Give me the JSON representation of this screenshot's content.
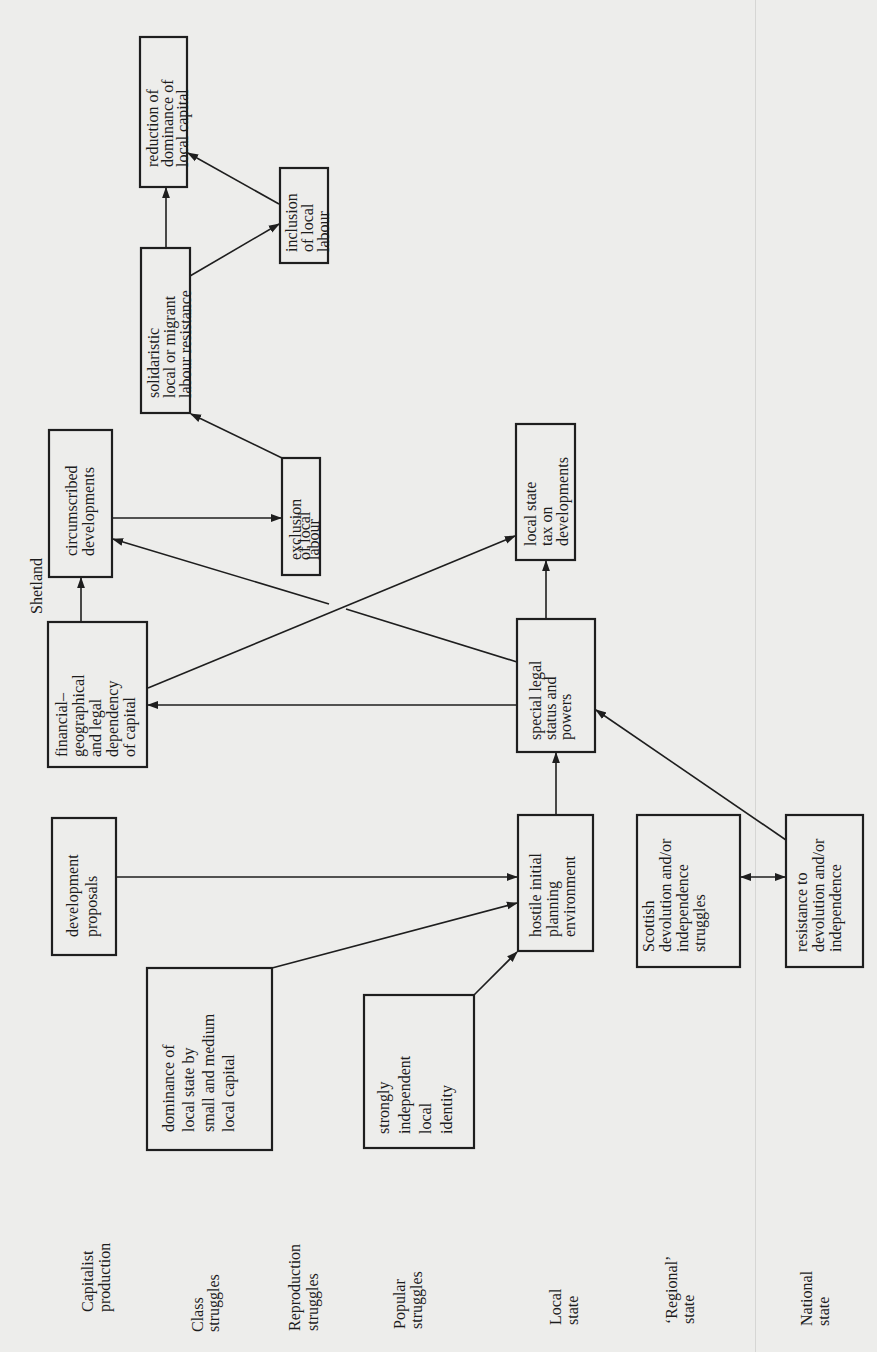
{
  "figure": {
    "orientation": "rotated-90-ccw",
    "region_label": "Shetland"
  },
  "row_labels": [
    {
      "id": "capitalist-production",
      "lines": [
        "Capitalist",
        "production"
      ]
    },
    {
      "id": "class-struggles",
      "lines": [
        "Class",
        "struggles"
      ]
    },
    {
      "id": "reproduction-struggles",
      "lines": [
        "Reproduction",
        "struggles"
      ]
    },
    {
      "id": "popular-struggles",
      "lines": [
        "Popular",
        "struggles"
      ]
    },
    {
      "id": "local-state",
      "lines": [
        "Local",
        "state"
      ]
    },
    {
      "id": "regional-state",
      "lines": [
        "‘Regional’",
        "state"
      ]
    },
    {
      "id": "national-state",
      "lines": [
        "National",
        "state"
      ]
    }
  ],
  "nodes": [
    {
      "id": "development-proposals",
      "lines": [
        "development",
        "proposals"
      ]
    },
    {
      "id": "dominance-local-state",
      "lines": [
        "dominance of",
        "local state by",
        "small and medium",
        "local capital"
      ]
    },
    {
      "id": "strongly-independent",
      "lines": [
        "strongly",
        "independent",
        "local",
        "identity"
      ]
    },
    {
      "id": "hostile-planning",
      "lines": [
        "hostile initial",
        "planning",
        "environment"
      ]
    },
    {
      "id": "scottish-devolution",
      "lines": [
        "Scottish",
        "devolution and/or",
        "independence",
        "struggles"
      ]
    },
    {
      "id": "resistance-devolution",
      "lines": [
        "resistance to",
        "devolution and/or",
        "independence"
      ]
    },
    {
      "id": "financial-dependency",
      "lines": [
        "financial–",
        "geographical",
        "and legal",
        "dependency",
        "of capital"
      ]
    },
    {
      "id": "special-legal-status",
      "lines": [
        "special legal",
        "status and",
        "powers"
      ]
    },
    {
      "id": "circumscribed-developments",
      "lines": [
        "circumscribed",
        "developments"
      ]
    },
    {
      "id": "exclusion-local-labour",
      "lines": [
        "exclusion",
        "of local",
        "labour"
      ]
    },
    {
      "id": "local-state-tax",
      "lines": [
        "local state",
        "tax on",
        "developments"
      ]
    },
    {
      "id": "solidaristic-resistance",
      "lines": [
        "solidaristic",
        "local or migrant",
        "labour resistance"
      ]
    },
    {
      "id": "inclusion-local-labour",
      "lines": [
        "inclusion",
        "of local",
        "labour"
      ]
    },
    {
      "id": "reduction-dominance",
      "lines": [
        "reduction of",
        "dominance of",
        "local capital"
      ]
    }
  ],
  "edges": [
    {
      "from": "development-proposals",
      "to": "hostile-planning"
    },
    {
      "from": "dominance-local-state",
      "to": "hostile-planning"
    },
    {
      "from": "strongly-independent",
      "to": "hostile-planning"
    },
    {
      "from": "hostile-planning",
      "to": "special-legal-status"
    },
    {
      "from": "resistance-devolution",
      "to": "special-legal-status"
    },
    {
      "from": "scottish-devolution",
      "to": "resistance-devolution",
      "bidirectional": true
    },
    {
      "from": "special-legal-status",
      "to": "financial-dependency"
    },
    {
      "from": "special-legal-status",
      "to": "local-state-tax"
    },
    {
      "from": "special-legal-status",
      "to": "circumscribed-developments"
    },
    {
      "from": "financial-dependency",
      "to": "local-state-tax"
    },
    {
      "from": "financial-dependency",
      "to": "circumscribed-developments"
    },
    {
      "from": "circumscribed-developments",
      "to": "exclusion-local-labour"
    },
    {
      "from": "exclusion-local-labour",
      "to": "solidaristic-resistance"
    },
    {
      "from": "solidaristic-resistance",
      "to": "reduction-dominance"
    },
    {
      "from": "solidaristic-resistance",
      "to": "inclusion-local-labour"
    },
    {
      "from": "inclusion-local-labour",
      "to": "reduction-dominance"
    }
  ]
}
